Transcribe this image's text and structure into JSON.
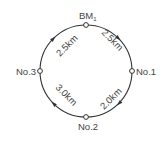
{
  "diagram": {
    "type": "leveling-loop",
    "direction": "clockwise",
    "colors": {
      "line": "#333333",
      "text": "#444444",
      "background": "#ffffff"
    },
    "nodes": [
      {
        "id": "bm1",
        "label": "BM",
        "subscript": "1",
        "position": "top"
      },
      {
        "id": "no1",
        "label": "No.1",
        "position": "right"
      },
      {
        "id": "no2",
        "label": "No.2",
        "position": "bottom"
      },
      {
        "id": "no3",
        "label": "No.3",
        "position": "left"
      }
    ],
    "segments": [
      {
        "from": "BM1",
        "to": "No.1",
        "distance": "2.5km"
      },
      {
        "from": "No.1",
        "to": "No.2",
        "distance": "2.0km"
      },
      {
        "from": "No.2",
        "to": "No.3",
        "distance": "3.0km"
      },
      {
        "from": "No.3",
        "to": "BM1",
        "distance": "2.5km"
      }
    ]
  }
}
